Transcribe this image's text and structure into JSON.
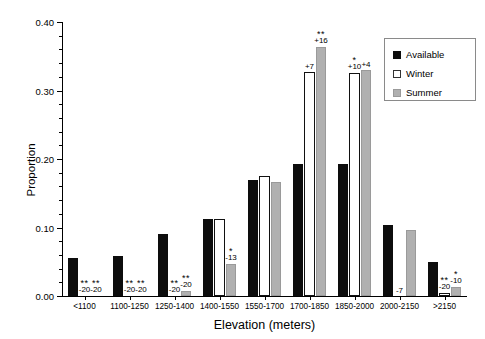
{
  "chart_data": {
    "type": "bar",
    "title": "",
    "xlabel": "Elevation (meters)",
    "ylabel": "Proportion",
    "ylim": [
      0.0,
      0.4
    ],
    "ytick_labels": [
      "0.00",
      "0.10",
      "0.20",
      "0.30",
      "0.40"
    ],
    "ytick_values": [
      0.0,
      0.1,
      0.2,
      0.3,
      0.4
    ],
    "minor_ticks_per_interval": 4,
    "grid": false,
    "legend_position": "top-right",
    "categories": [
      "<1100",
      "1100-1250",
      "1250-1400",
      "1400-1550",
      "1550-1700",
      "1700-1850",
      "1850-2000",
      "2000-2150",
      ">2150"
    ],
    "series": [
      {
        "name": "Available",
        "color": "#0d0d0d",
        "values": [
          0.055,
          0.058,
          0.09,
          0.113,
          0.17,
          0.193,
          0.193,
          0.103,
          0.05
        ],
        "annotations": [
          "",
          "",
          "",
          "",
          "",
          "",
          "",
          "",
          ""
        ]
      },
      {
        "name": "Winter",
        "color": "#ffffff",
        "values": [
          0.0,
          0.0,
          0.0,
          0.113,
          0.175,
          0.327,
          0.325,
          0.0,
          0.005
        ],
        "annotations": [
          "-20",
          "-20",
          "-20",
          "",
          "",
          "+7",
          "+10",
          "-7",
          "-20"
        ],
        "significance": [
          "**",
          "**",
          "**",
          "",
          "",
          "",
          "*",
          "",
          "**"
        ]
      },
      {
        "name": "Summer",
        "color": "#b0b0b0",
        "values": [
          0.0,
          0.0,
          0.008,
          0.047,
          0.167,
          0.363,
          0.33,
          0.097,
          0.013
        ],
        "annotations": [
          "-20",
          "-20",
          "-20",
          "-13",
          "",
          "+16",
          "+4",
          "",
          "-10"
        ],
        "significance": [
          "**",
          "**",
          "**",
          "*",
          "",
          "**",
          "",
          "",
          "*"
        ]
      }
    ]
  },
  "legend": {
    "items": [
      {
        "label": "Available",
        "swatch": "available"
      },
      {
        "label": "Winter",
        "swatch": "winter"
      },
      {
        "label": "Summer",
        "swatch": "summer"
      }
    ]
  },
  "axes": {
    "y_title": "Proportion",
    "x_title": "Elevation (meters)"
  }
}
